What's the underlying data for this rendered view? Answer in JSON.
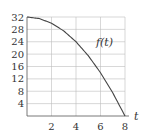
{
  "chart_data": {
    "type": "line",
    "title": "",
    "xlabel": "t",
    "ylabel": "",
    "xlim": [
      0,
      8
    ],
    "ylim": [
      0,
      32
    ],
    "grid": true,
    "x_ticks": [
      2,
      4,
      6,
      8
    ],
    "y_ticks": [
      4,
      8,
      12,
      16,
      20,
      24,
      28,
      32
    ],
    "series": [
      {
        "name": "f(t)",
        "formula": "f(t) = 32 - t^2/2",
        "x": [
          0,
          1,
          2,
          3,
          4,
          5,
          6,
          7,
          8
        ],
        "y": [
          32,
          31.5,
          30,
          27.5,
          24,
          19.5,
          14,
          7.5,
          0
        ],
        "color": "#444444"
      }
    ],
    "annotations": [
      {
        "text": "f(t)",
        "x": 5.7,
        "y": 24
      }
    ],
    "legend": "none"
  },
  "colors": {
    "grid": "#bdbdbd",
    "axis": "#555555",
    "curve": "#444444",
    "text": "#333333"
  },
  "labels": {
    "curve_label": "f(t)",
    "x_axis_label": "t"
  }
}
